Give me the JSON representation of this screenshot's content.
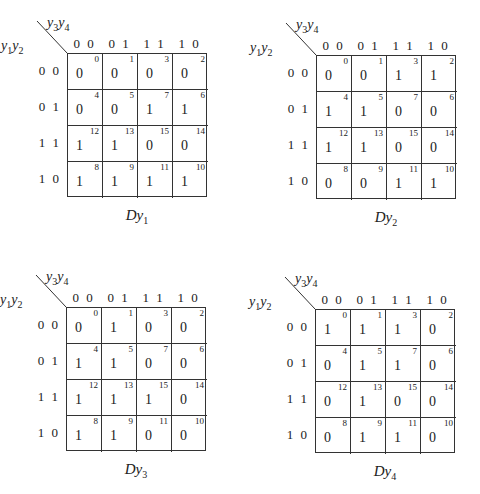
{
  "row_var": {
    "base": "y",
    "sub1": "1",
    "base2": "y",
    "sub2": "2"
  },
  "col_var": {
    "base": "y",
    "sub1": "3",
    "base2": "y",
    "sub2": "4"
  },
  "col_labels": [
    "0 0",
    "0 1",
    "1 1",
    "1 0"
  ],
  "row_labels": [
    "0 0",
    "0 1",
    "1 1",
    "1 0"
  ],
  "cell_indices": [
    [
      "0",
      "1",
      "3",
      "2"
    ],
    [
      "4",
      "5",
      "7",
      "6"
    ],
    [
      "12",
      "13",
      "15",
      "14"
    ],
    [
      "8",
      "9",
      "11",
      "10"
    ]
  ],
  "maps": [
    {
      "caption_base": "Dy",
      "caption_sub": "1",
      "values": [
        [
          "0",
          "0",
          "0",
          "0"
        ],
        [
          "0",
          "0",
          "1",
          "1"
        ],
        [
          "1",
          "1",
          "0",
          "0"
        ],
        [
          "1",
          "1",
          "1",
          "1"
        ]
      ]
    },
    {
      "caption_base": "Dy",
      "caption_sub": "2",
      "values": [
        [
          "0",
          "0",
          "1",
          "1"
        ],
        [
          "1",
          "1",
          "0",
          "0"
        ],
        [
          "1",
          "1",
          "0",
          "0"
        ],
        [
          "0",
          "0",
          "1",
          "1"
        ]
      ]
    },
    {
      "caption_base": "Dy",
      "caption_sub": "3",
      "values": [
        [
          "0",
          "1",
          "0",
          "0"
        ],
        [
          "1",
          "1",
          "0",
          "0"
        ],
        [
          "1",
          "1",
          "1",
          "0"
        ],
        [
          "1",
          "1",
          "0",
          "0"
        ]
      ]
    },
    {
      "caption_base": "Dy",
      "caption_sub": "4",
      "values": [
        [
          "1",
          "1",
          "1",
          "0"
        ],
        [
          "0",
          "1",
          "1",
          "0"
        ],
        [
          "0",
          "1",
          "0",
          "0"
        ],
        [
          "0",
          "1",
          "1",
          "0"
        ]
      ]
    }
  ]
}
